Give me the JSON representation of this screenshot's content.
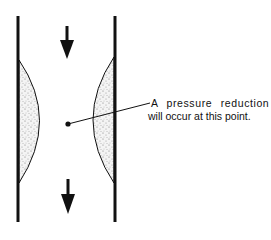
{
  "diagram": {
    "annotation": {
      "line1": "A pressure reduction",
      "line2": "will occur at this point."
    },
    "elements": {
      "left_wall": "pipe-wall",
      "right_wall": "pipe-wall",
      "left_deposit": "stippled-constriction",
      "right_deposit": "stippled-constriction",
      "top_arrow": "flow-direction-down",
      "bottom_arrow": "flow-direction-down",
      "point_marker": "pressure-point-dot"
    },
    "colors": {
      "ink": "#111111",
      "background": "#ffffff",
      "stipple": "#777777"
    }
  }
}
